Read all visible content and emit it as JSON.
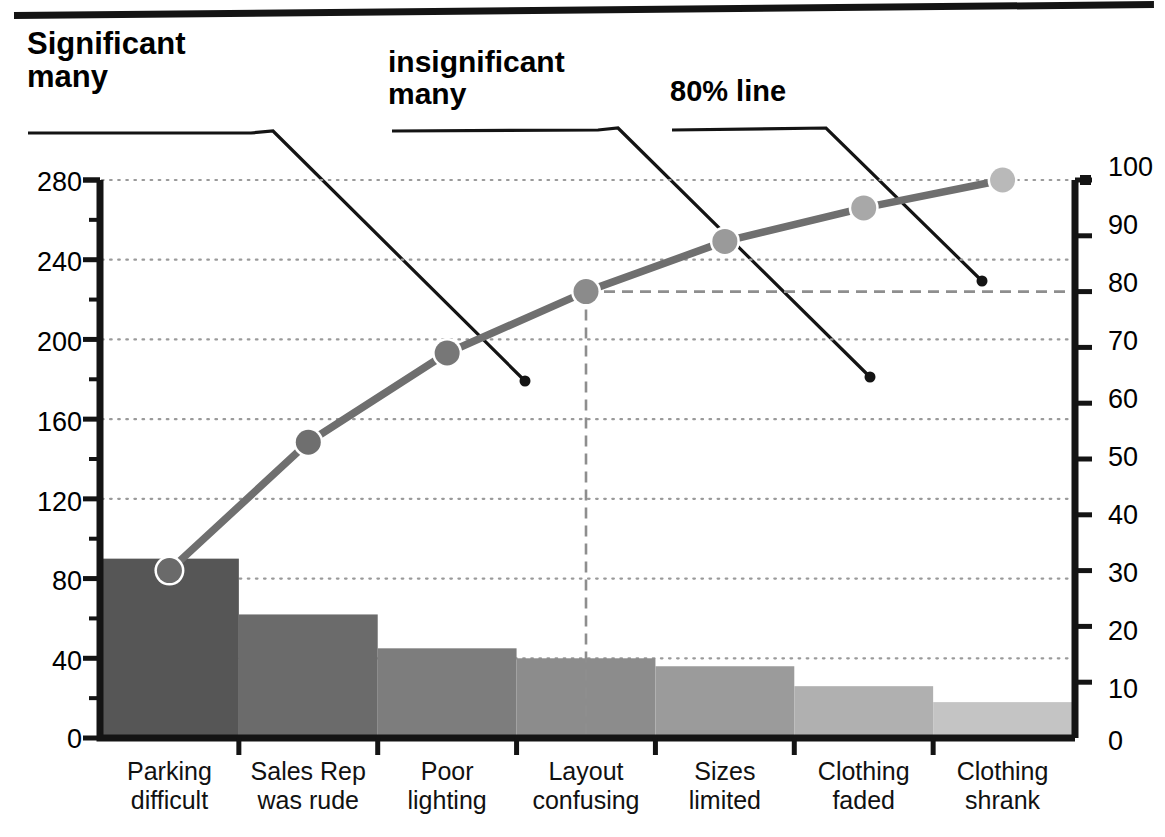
{
  "figure": {
    "top_rule": "horizontal-rule"
  },
  "annotations": [
    {
      "id": "significant-many",
      "label": "Significant\nmany",
      "line1": "Significant",
      "line2": "many"
    },
    {
      "id": "insignificant-many",
      "label": "insignificant\nmany",
      "line1": "insignificant",
      "line2": "many"
    },
    {
      "id": "eighty-percent-line",
      "label": "80% line",
      "line1": "80% line",
      "line2": ""
    }
  ],
  "colors": {
    "ink": "#141414",
    "bar_shades": [
      "#565656",
      "#6b6b6b",
      "#7d7d7d",
      "#8c8c8c",
      "#9b9b9b",
      "#b0b0b0",
      "#c4c4c4"
    ],
    "cum_line": "#6f6f6f",
    "marker_shades": [
      "#6a6a6a",
      "#6f6f6f",
      "#777777",
      "#8b8b8b",
      "#9a9a9a",
      "#a8a8a8",
      "#b9b9b9"
    ],
    "grid": "#9a9a9a",
    "dash_80": "#8e8e8e"
  },
  "chart_data": {
    "type": "bar",
    "title": "",
    "subtitle": "",
    "xlabel": "",
    "ylabel": "",
    "grid": true,
    "legend_position": "none",
    "categories": [
      "Parking difficult",
      "Sales Rep was rude",
      "Poor lighting",
      "Layout confusing",
      "Sizes limited",
      "Clothing faded",
      "Clothing shrank"
    ],
    "category_lines": [
      [
        "Parking",
        "difficult"
      ],
      [
        "Sales Rep",
        "was rude"
      ],
      [
        "Poor",
        "lighting"
      ],
      [
        "Layout",
        "confusing"
      ],
      [
        "Sizes",
        "limited"
      ],
      [
        "Clothing",
        "faded"
      ],
      [
        "Clothing",
        "shrank"
      ]
    ],
    "series": [
      {
        "name": "Count",
        "axis": "left",
        "type": "bar",
        "values": [
          90,
          62,
          45,
          40,
          36,
          26,
          18
        ]
      },
      {
        "name": "Cumulative %",
        "axis": "right",
        "type": "line",
        "values": [
          30,
          53,
          69,
          80,
          89,
          95,
          100
        ]
      }
    ],
    "left_axis": {
      "label": "",
      "ylim": [
        0,
        280
      ],
      "ticks": [
        0,
        40,
        80,
        120,
        160,
        200,
        240,
        280
      ],
      "tick_labels": [
        "0",
        "40",
        "80",
        "120",
        "160",
        "200",
        "240",
        "280"
      ],
      "minor_step": 20
    },
    "right_axis": {
      "label": "",
      "ylim": [
        0,
        100
      ],
      "ticks": [
        0,
        10,
        20,
        30,
        40,
        50,
        60,
        70,
        80,
        90,
        100
      ],
      "tick_labels": [
        "0",
        "10",
        "20",
        "30",
        "40",
        "50",
        "60",
        "70",
        "80",
        "90",
        "100"
      ]
    },
    "reference_lines": [
      {
        "name": "80% line",
        "axis": "right",
        "value": 80,
        "style": "dashed"
      }
    ]
  }
}
